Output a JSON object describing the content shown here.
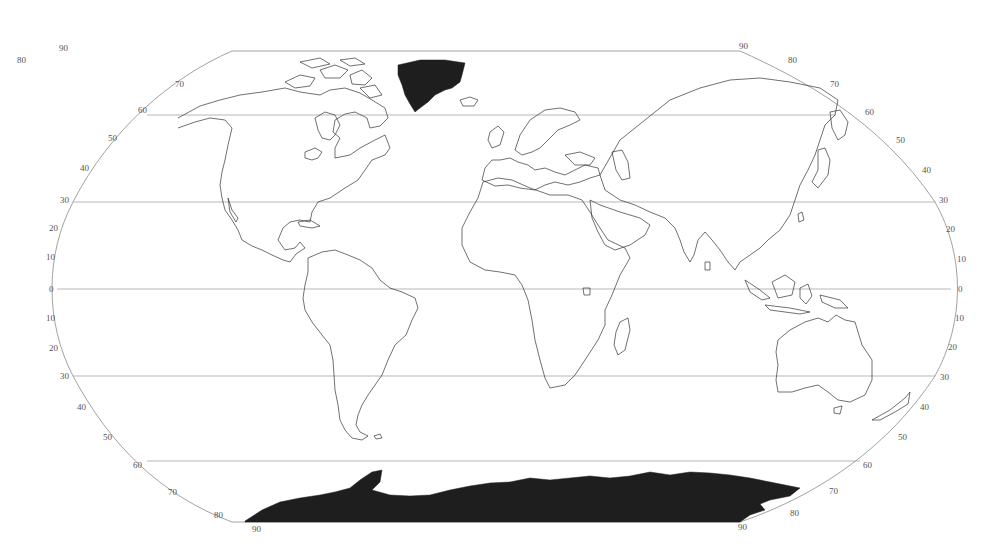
{
  "map": {
    "projection": "Robinson-like pseudocylindrical world outline",
    "colors": {
      "background": "#ffffff",
      "outline": "#8a8a8a",
      "gridline": "#9a9a9a",
      "coastline": "#333333",
      "ice_fill": "#1e1e1e",
      "label": "#555555"
    },
    "gridlines_y": [
      {
        "lat": 60,
        "y": 115
      },
      {
        "lat": 30,
        "y": 202
      },
      {
        "lat": 0,
        "y": 289
      },
      {
        "lat": -30,
        "y": 376
      },
      {
        "lat": -60,
        "y": 461
      }
    ],
    "left_labels": [
      {
        "text": "90",
        "x": 59,
        "y": 51
      },
      {
        "text": "80",
        "x": 17,
        "y": 63
      },
      {
        "text": "70",
        "x": 175,
        "y": 87
      },
      {
        "text": "60",
        "x": 138,
        "y": 113
      },
      {
        "text": "50",
        "x": 108,
        "y": 141
      },
      {
        "text": "40",
        "x": 80,
        "y": 171
      },
      {
        "text": "30",
        "x": 60,
        "y": 203
      },
      {
        "text": "20",
        "x": 49,
        "y": 231
      },
      {
        "text": "10",
        "x": 46,
        "y": 260
      },
      {
        "text": "0",
        "x": 49,
        "y": 289
      },
      {
        "text": "10",
        "x": 46,
        "y": 318
      },
      {
        "text": "20",
        "x": 49,
        "y": 348
      },
      {
        "text": "30",
        "x": 60,
        "y": 376
      },
      {
        "text": "40",
        "x": 77,
        "y": 407
      },
      {
        "text": "50",
        "x": 103,
        "y": 437
      },
      {
        "text": "60",
        "x": 133,
        "y": 465
      },
      {
        "text": "70",
        "x": 168,
        "y": 492
      },
      {
        "text": "80",
        "x": 214,
        "y": 515
      },
      {
        "text": "90",
        "x": 252,
        "y": 529
      }
    ],
    "right_labels": [
      {
        "text": "90",
        "x": 739,
        "y": 49
      },
      {
        "text": "80",
        "x": 788,
        "y": 63
      },
      {
        "text": "70",
        "x": 830,
        "y": 87
      },
      {
        "text": "60",
        "x": 865,
        "y": 112
      },
      {
        "text": "50",
        "x": 896,
        "y": 140
      },
      {
        "text": "40",
        "x": 922,
        "y": 170
      },
      {
        "text": "30",
        "x": 939,
        "y": 200
      },
      {
        "text": "20",
        "x": 946,
        "y": 229
      },
      {
        "text": "10",
        "x": 957,
        "y": 259
      },
      {
        "text": "0",
        "x": 958,
        "y": 289
      },
      {
        "text": "10",
        "x": 955,
        "y": 318
      },
      {
        "text": "20",
        "x": 948,
        "y": 347
      },
      {
        "text": "30",
        "x": 940,
        "y": 377
      },
      {
        "text": "40",
        "x": 920,
        "y": 407
      },
      {
        "text": "50",
        "x": 898,
        "y": 437
      },
      {
        "text": "60",
        "x": 863,
        "y": 465
      },
      {
        "text": "70",
        "x": 829,
        "y": 491
      },
      {
        "text": "80",
        "x": 790,
        "y": 513
      },
      {
        "text": "90",
        "x": 738,
        "y": 527
      }
    ]
  }
}
